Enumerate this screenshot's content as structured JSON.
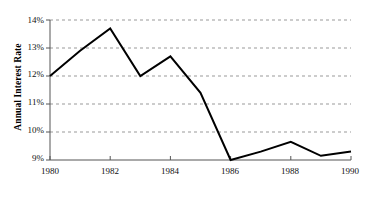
{
  "chart_data": {
    "type": "line",
    "title": "",
    "xlabel": "Year",
    "ylabel": "Annual Interest Rate",
    "x": [
      1980,
      1981,
      1982,
      1983,
      1984,
      1985,
      1986,
      1987,
      1988,
      1989,
      1990
    ],
    "values": [
      12.0,
      12.9,
      13.7,
      12.0,
      12.7,
      11.4,
      9.0,
      9.3,
      9.65,
      9.15,
      9.3
    ],
    "xlim": [
      1980,
      1990
    ],
    "ylim": [
      9,
      14
    ],
    "x_ticks": [
      1980,
      1982,
      1984,
      1986,
      1988,
      1990
    ],
    "x_tick_labels": [
      "1980",
      "1982",
      "1984",
      "1986",
      "1988",
      "1990"
    ],
    "y_ticks": [
      9,
      10,
      11,
      12,
      13,
      14
    ],
    "y_tick_labels": [
      "9%",
      "10%",
      "11%",
      "12%",
      "13%",
      "14%"
    ],
    "grid": true,
    "grid_style": "dashed",
    "grid_color": "#999999",
    "line_color": "#000000",
    "line_width": 2,
    "legend": null,
    "markers": false,
    "series": [
      {
        "name": "Annual Interest Rate",
        "values": [
          12.0,
          12.9,
          13.7,
          12.0,
          12.7,
          11.4,
          9.0,
          9.3,
          9.65,
          9.15,
          9.3
        ]
      }
    ]
  },
  "axes": {
    "y_title": "Annual Interest Rate",
    "x_title": "Year",
    "y_labels": [
      "14%",
      "13%",
      "12%",
      "11%",
      "10%",
      "9%"
    ],
    "x_labels": [
      "1980",
      "1982",
      "1984",
      "1986",
      "1988",
      "1990"
    ]
  }
}
